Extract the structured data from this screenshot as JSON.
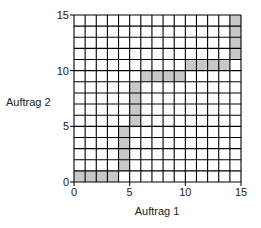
{
  "chart_data": {
    "type": "diagram-grid",
    "title": "",
    "xlabel": "Auftrag 1",
    "ylabel": "Auftrag 2",
    "xlim": [
      0,
      15
    ],
    "ylim": [
      0,
      15
    ],
    "grid": true,
    "grid_step": 1,
    "x_ticks": [
      0,
      5,
      10,
      15
    ],
    "y_ticks": [
      0,
      5,
      10,
      15
    ],
    "x_tick_labels": [
      "0",
      "5",
      "10",
      "15"
    ],
    "y_tick_labels": [
      "0",
      "5",
      "10",
      "15"
    ],
    "blocks": [
      {
        "x0": 0,
        "x1": 4,
        "y0": 0,
        "y1": 1
      },
      {
        "x0": 4,
        "x1": 5,
        "y0": 1,
        "y1": 5
      },
      {
        "x0": 5,
        "x1": 6,
        "y0": 5,
        "y1": 9
      },
      {
        "x0": 6,
        "x1": 10,
        "y0": 9,
        "y1": 10
      },
      {
        "x0": 10,
        "x1": 14,
        "y0": 10,
        "y1": 11
      },
      {
        "x0": 14,
        "x1": 15,
        "y0": 11,
        "y1": 15
      }
    ],
    "block_color": "#c8c8c8",
    "grid_color": "#000000"
  }
}
